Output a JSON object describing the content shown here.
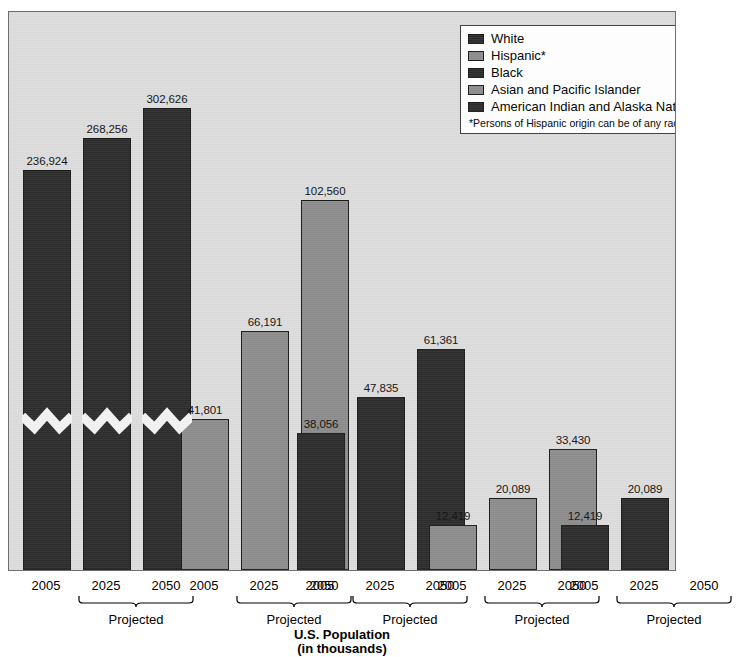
{
  "caption": {
    "line1": "U.S. Population",
    "line2": "(in thousands)"
  },
  "cropped_title": "Projected Population Change by Race and Ethnicity",
  "legend": {
    "items": [
      {
        "label": "White",
        "swatch": "dark"
      },
      {
        "label": "Hispanic*",
        "swatch": "light"
      },
      {
        "label": "Black",
        "swatch": "dark"
      },
      {
        "label": "Asian and Pacific Islander",
        "swatch": "light"
      },
      {
        "label": "American Indian and Alaska Natives",
        "swatch": "dark"
      }
    ],
    "footnote": "*Persons of Hispanic origin can be of any race."
  },
  "axis": {
    "projected_label": "Projected",
    "years": [
      "2005",
      "2025",
      "2050"
    ]
  },
  "chart_data": {
    "type": "bar",
    "title": "U.S. Population (in thousands)",
    "xlabel": "U.S. Population (in thousands)",
    "ylabel": "",
    "grid": false,
    "legend_position": "top-right",
    "axis_break": true,
    "axis_break_note": "Vertical axis is broken for the White series bars",
    "categories": [
      "2005",
      "2025",
      "2050"
    ],
    "category_notes": [
      "",
      "Projected",
      "Projected"
    ],
    "series": [
      {
        "name": "White",
        "color": "#2c2c2c",
        "values": [
          236924,
          268256,
          302626
        ],
        "labels": [
          "236,924",
          "268,256",
          "302,626"
        ]
      },
      {
        "name": "Hispanic*",
        "color": "#8c8c8c",
        "values": [
          41801,
          66191,
          102560
        ],
        "labels": [
          "41,801",
          "66,191",
          "102,560"
        ]
      },
      {
        "name": "Black",
        "color": "#2c2c2c",
        "values": [
          38056,
          47835,
          61361
        ],
        "labels": [
          "38,056",
          "47,835",
          "61,361"
        ]
      },
      {
        "name": "Asian and Pacific Islander",
        "color": "#8c8c8c",
        "values": [
          12419,
          20089,
          33430
        ],
        "labels": [
          "12,419",
          "20,089",
          "33,430"
        ]
      },
      {
        "name": "American Indian and Alaska Natives",
        "color": "#2c2c2c",
        "values": [
          12419,
          20089,
          33430
        ],
        "labels": [
          "12,419",
          "20,089",
          "33,430"
        ]
      }
    ]
  },
  "colors": {
    "plot_background": "#dcdcdc",
    "bar_dark": "#2c2c2c",
    "bar_light": "#8c8c8c",
    "border": "#6e6e6e",
    "legend_background": "#ffffff"
  }
}
